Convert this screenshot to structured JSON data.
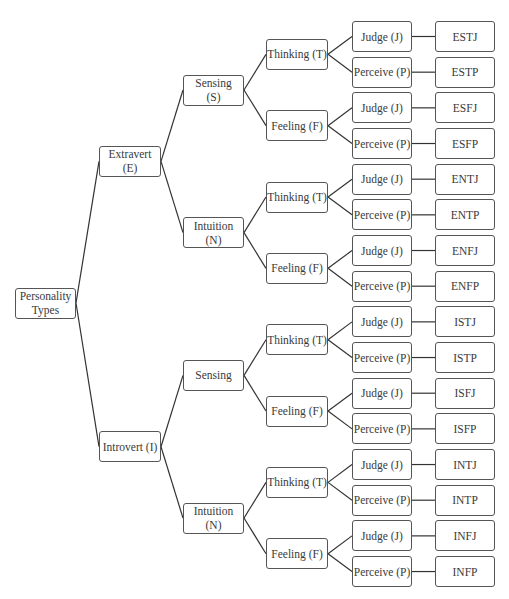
{
  "diagram": {
    "root": {
      "label": "Personality\nTypes"
    },
    "level1": [
      {
        "label": "Extravert\n(E)"
      },
      {
        "label": "Introvert (I)"
      }
    ],
    "level2": [
      {
        "label": "Sensing\n(S)"
      },
      {
        "label": "Intuition\n(N)"
      },
      {
        "label": "Sensing"
      },
      {
        "label": "Intuition\n(N)"
      }
    ],
    "level3": [
      {
        "label": "Thinking (T)"
      },
      {
        "label": "Feeling (F)"
      },
      {
        "label": "Thinking (T)"
      },
      {
        "label": "Feeling (F)"
      },
      {
        "label": "Thinking (T)"
      },
      {
        "label": "Feeling (F)"
      },
      {
        "label": "Thinking (T)"
      },
      {
        "label": "Feeling (F)"
      }
    ],
    "level4": [
      {
        "label": "Judge (J)"
      },
      {
        "label": "Perceive (P)"
      },
      {
        "label": "Judge (J)"
      },
      {
        "label": "Perceive (P)"
      },
      {
        "label": "Judge (J)"
      },
      {
        "label": "Perceive (P)"
      },
      {
        "label": "Judge (J)"
      },
      {
        "label": "Perceive (P)"
      },
      {
        "label": "Judge (J)"
      },
      {
        "label": "Perceive (P)"
      },
      {
        "label": "Judge (J)"
      },
      {
        "label": "Perceive (P)"
      },
      {
        "label": "Judge (J)"
      },
      {
        "label": "Perceive (P)"
      },
      {
        "label": "Judge (J)"
      },
      {
        "label": "Perceive (P)"
      }
    ],
    "types": [
      {
        "label": "ESTJ"
      },
      {
        "label": "ESTP"
      },
      {
        "label": "ESFJ"
      },
      {
        "label": "ESFP"
      },
      {
        "label": "ENTJ"
      },
      {
        "label": "ENTP"
      },
      {
        "label": "ENFJ"
      },
      {
        "label": "ENFP"
      },
      {
        "label": "ISTJ"
      },
      {
        "label": "ISTP"
      },
      {
        "label": "ISFJ"
      },
      {
        "label": "ISFP"
      },
      {
        "label": "INTJ"
      },
      {
        "label": "INTP"
      },
      {
        "label": "INFJ"
      },
      {
        "label": "INFP"
      }
    ]
  }
}
